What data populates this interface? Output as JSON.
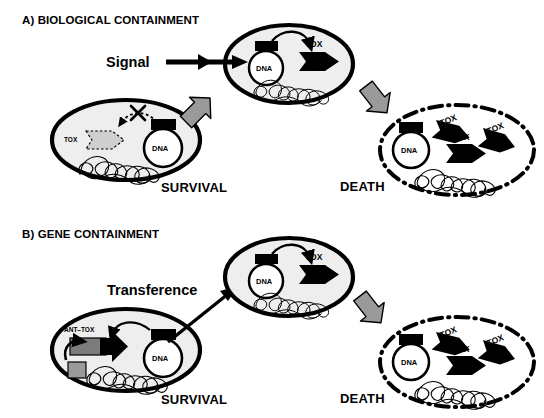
{
  "figure": {
    "type": "diagram",
    "caption_absent": true,
    "panels": [
      {
        "id": "A",
        "title": "A) BIOLOGICAL CONTAINMENT",
        "flow_label": "Signal",
        "survival_label": "SURVIVAL",
        "death_label": "DEATH",
        "survival_cell": {
          "plasmid_label": "DNA",
          "toxin_label": "TOX",
          "toxin_state": "repressed",
          "blocked_marker": "X"
        },
        "induced_cell": {
          "plasmid_label": "DNA",
          "toxin_label": "TOX"
        },
        "death_cell": {
          "plasmid_label": "DNA",
          "toxin_labels": [
            "TOX",
            "TOX",
            "TOX"
          ]
        }
      },
      {
        "id": "B",
        "title": "B) GENE CONTAINMENT",
        "flow_label": "Transference",
        "survival_label": "SURVIVAL",
        "death_label": "DEATH",
        "survival_cell": {
          "plasmid_label": "DNA",
          "operon_label": "ANT–TOX",
          "toxin_state": "antitoxin-protected"
        },
        "induced_cell": {
          "plasmid_label": "DNA",
          "toxin_label": "TOX"
        },
        "death_cell": {
          "plasmid_label": "DNA",
          "toxin_labels": [
            "TOX",
            "TOX",
            "TOX"
          ]
        }
      }
    ],
    "icons": [
      "cell-membrane-oval",
      "plasmid-circle-icon",
      "promoter-box-icon",
      "toxin-arrow-icon",
      "antitoxin-arrow-icon",
      "chromosome-tangle-icon",
      "block-arrow-icon",
      "cross-out-icon",
      "dash-dot-membrane-icon"
    ],
    "colors": {
      "outline": "#000000",
      "cell_fill": "#eeeeee",
      "block_arrow_fill": "#9a9a9a",
      "repressed_fill": "#cfcfcf",
      "antitoxin_fill": "#7c7c7c",
      "white": "#ffffff"
    }
  }
}
